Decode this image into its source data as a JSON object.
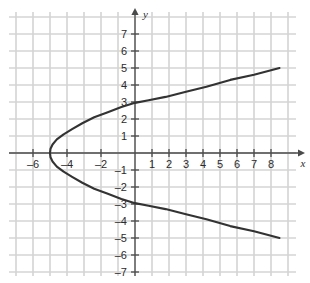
{
  "chart_data": {
    "type": "line",
    "title": "",
    "subtitle": "",
    "xlabel": "x",
    "ylabel": "y",
    "grid": true,
    "legend": null,
    "xlim": [
      -7.4,
      9.4
    ],
    "ylim": [
      -7.6,
      7.9
    ],
    "x_tick_labels": [
      "-6",
      "-4",
      "-2",
      "1",
      "2",
      "3",
      "4",
      "5",
      "6",
      "7",
      "8"
    ],
    "x_tick_values": [
      -6,
      -4,
      -2,
      1,
      2,
      3,
      4,
      5,
      6,
      7,
      8
    ],
    "y_tick_labels": [
      "7",
      "6",
      "5",
      "4",
      "3",
      "2",
      "1",
      "-1",
      "-2",
      "-3",
      "-4",
      "-5",
      "-6",
      "-7"
    ],
    "y_tick_values": [
      7,
      6,
      5,
      4,
      3,
      2,
      1,
      -1,
      -2,
      -3,
      -4,
      -5,
      -6,
      -7
    ],
    "series": [
      {
        "name": "sideways-parabola",
        "equation": "x = y^2 - 5",
        "vertex": [
          -5,
          0
        ],
        "y_intercepts": [
          3,
          -3
        ],
        "endpoints": [
          [
            8.5,
            5
          ],
          [
            8.5,
            -5
          ]
        ],
        "points": [
          [
            8.5,
            -5.0
          ],
          [
            7.0,
            -4.6
          ],
          [
            5.6,
            -4.3
          ],
          [
            4.2,
            -3.9
          ],
          [
            3.0,
            -3.6
          ],
          [
            1.8,
            -3.3
          ],
          [
            0.8,
            -3.1
          ],
          [
            0.0,
            -2.95
          ],
          [
            -0.8,
            -2.7
          ],
          [
            -1.6,
            -2.4
          ],
          [
            -2.4,
            -2.1
          ],
          [
            -3.1,
            -1.75
          ],
          [
            -3.7,
            -1.4
          ],
          [
            -4.2,
            -1.1
          ],
          [
            -4.6,
            -0.8
          ],
          [
            -4.85,
            -0.5
          ],
          [
            -4.97,
            -0.25
          ],
          [
            -5.0,
            0.0
          ],
          [
            -4.97,
            0.25
          ],
          [
            -4.85,
            0.5
          ],
          [
            -4.6,
            0.8
          ],
          [
            -4.2,
            1.1
          ],
          [
            -3.7,
            1.4
          ],
          [
            -3.1,
            1.75
          ],
          [
            -2.4,
            2.1
          ],
          [
            -1.6,
            2.4
          ],
          [
            -0.8,
            2.7
          ],
          [
            0.0,
            2.95
          ],
          [
            0.8,
            3.1
          ],
          [
            1.8,
            3.3
          ],
          [
            3.0,
            3.6
          ],
          [
            4.2,
            3.9
          ],
          [
            5.6,
            4.3
          ],
          [
            7.0,
            4.6
          ],
          [
            8.5,
            5.0
          ]
        ]
      }
    ],
    "colors": {
      "curve": "#333333",
      "grid": "#d4d4d4",
      "axis": "#4a4a4a",
      "background": "#ffffff",
      "text": "#2b2b2b"
    }
  },
  "axes": {
    "x_axis_name": "x",
    "y_axis_name": "y"
  }
}
